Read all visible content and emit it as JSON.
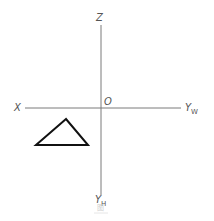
{
  "diagram": {
    "type": "projection-axes",
    "axes": {
      "vertical": {
        "x": 101,
        "y1": 25,
        "y2": 195,
        "color": "#777777"
      },
      "horizontal": {
        "y": 108,
        "x1": 25,
        "x2": 181,
        "color": "#777777"
      }
    },
    "labels": {
      "z": {
        "text": "Z"
      },
      "x": {
        "text": "X"
      },
      "origin": {
        "text": "O"
      },
      "yw": {
        "text": "Y",
        "sub": "W"
      },
      "yh": {
        "text": "Y",
        "sub": "H"
      }
    },
    "triangle": {
      "points": "66,119 36,145 88,145",
      "stroke": "#111111",
      "stroke_width": 2
    },
    "caption": {
      "text": "图"
    }
  }
}
